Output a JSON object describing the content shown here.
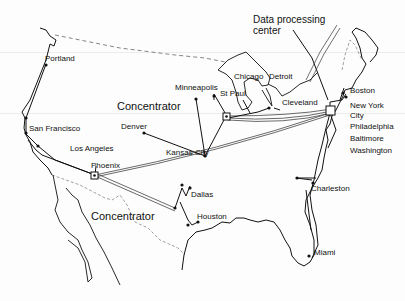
{
  "diagram": {
    "callouts": {
      "data_processing_center": [
        "Data processing",
        "center"
      ],
      "concentrator_north": "Concentrator",
      "concentrator_south": "Concentrator"
    },
    "cities": [
      {
        "name": "Portland"
      },
      {
        "name": "San Francisco"
      },
      {
        "name": "Los Angeles"
      },
      {
        "name": "Phoenix"
      },
      {
        "name": "Denver"
      },
      {
        "name": "Kansas City"
      },
      {
        "name": "Minneapolis"
      },
      {
        "name": "St Paul"
      },
      {
        "name": "Chicago"
      },
      {
        "name": "Detroit"
      },
      {
        "name": "Cleveland"
      },
      {
        "name": "Boston"
      },
      {
        "name": "New York",
        "name2": "City"
      },
      {
        "name": "Philadelphia"
      },
      {
        "name": "Baltimore"
      },
      {
        "name": "Washington"
      },
      {
        "name": "Charleston"
      },
      {
        "name": "Dallas"
      },
      {
        "name": "Houston"
      },
      {
        "name": "Miami"
      }
    ],
    "colors": {
      "ink": "#111111",
      "trunk": "#555555",
      "border_dashed": "#777777"
    }
  }
}
